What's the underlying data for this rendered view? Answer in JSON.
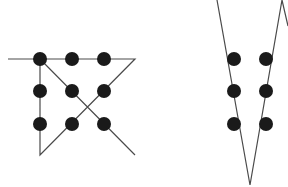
{
  "diagram": {
    "title": "",
    "colors": {
      "background": "#ffffff",
      "dot": "#1a1a1a",
      "line": "#4a4a4a"
    },
    "dot_radius": 7,
    "line_width": 1.2,
    "puzzles": [
      {
        "id": "left-puzzle",
        "dots": [
          {
            "x": 40,
            "y": 59
          },
          {
            "x": 72,
            "y": 59
          },
          {
            "x": 104,
            "y": 59
          },
          {
            "x": 40,
            "y": 91
          },
          {
            "x": 72,
            "y": 91
          },
          {
            "x": 104,
            "y": 91
          },
          {
            "x": 40,
            "y": 124
          },
          {
            "x": 72,
            "y": 124
          },
          {
            "x": 104,
            "y": 124
          }
        ],
        "path": [
          [
            8,
            59
          ],
          [
            135,
            59
          ],
          [
            40,
            155
          ],
          [
            40,
            59
          ],
          [
            135,
            155
          ]
        ]
      },
      {
        "id": "right-puzzle",
        "dots": [
          {
            "x": 234,
            "y": 59
          },
          {
            "x": 266,
            "y": 59
          },
          {
            "x": 234,
            "y": 91
          },
          {
            "x": 266,
            "y": 91
          },
          {
            "x": 234,
            "y": 124
          },
          {
            "x": 266,
            "y": 124
          }
        ],
        "path": [
          [
            217,
            0
          ],
          [
            250,
            185
          ],
          [
            282,
            0
          ],
          [
            288,
            26
          ]
        ]
      }
    ]
  }
}
